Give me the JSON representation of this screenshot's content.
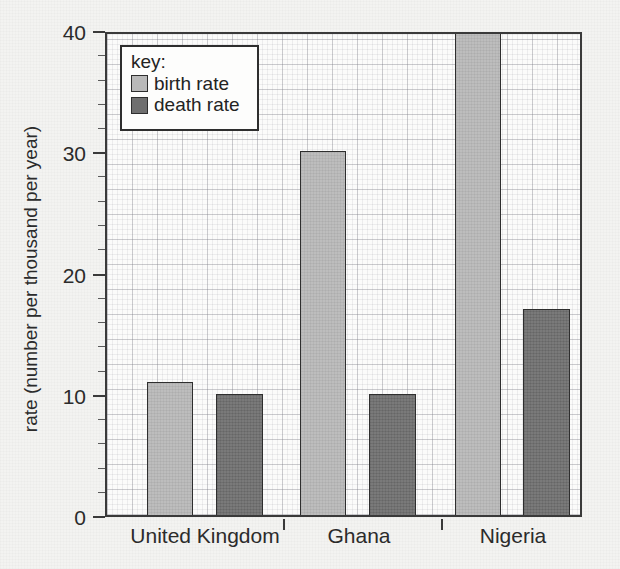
{
  "chart_data": {
    "type": "bar",
    "title": "",
    "xlabel": "",
    "ylabel": "rate (number per thousand per year)",
    "categories": [
      "United Kingdom",
      "Ghana",
      "Nigeria"
    ],
    "series": [
      {
        "name": "birth rate",
        "values": [
          11,
          30,
          40
        ],
        "color": "#b9b9b9"
      },
      {
        "name": "death rate",
        "values": [
          10,
          10,
          17
        ],
        "color": "#6f6f6f"
      }
    ],
    "ylim": [
      0,
      40
    ],
    "ytick_labels": [
      "0",
      "10",
      "20",
      "30",
      "40"
    ],
    "ytick_values": [
      0,
      10,
      20,
      30,
      40
    ],
    "grid": true,
    "grid_style": "graph-paper",
    "legend_position": "top-left",
    "legend_title": "key:"
  },
  "legend": {
    "title": "key:",
    "entries": [
      {
        "label": "birth rate",
        "swatch": "birth"
      },
      {
        "label": "death rate",
        "swatch": "death"
      }
    ]
  },
  "axes": {
    "y_title": "rate (number per thousand per year)",
    "y_ticks": [
      {
        "label": "40",
        "value": 40
      },
      {
        "label": "30",
        "value": 30
      },
      {
        "label": "20",
        "value": 20
      },
      {
        "label": "10",
        "value": 10
      },
      {
        "label": "0",
        "value": 0
      }
    ],
    "x_categories": [
      {
        "label": "United Kingdom"
      },
      {
        "label": "Ghana"
      },
      {
        "label": "Nigeria"
      }
    ]
  },
  "colors": {
    "birth_rate": "#b9b9b9",
    "death_rate": "#6f6f6f",
    "axis": "#3a3a3a",
    "paper": "#f3f3f1",
    "plot_background": "#fbfbfa"
  }
}
